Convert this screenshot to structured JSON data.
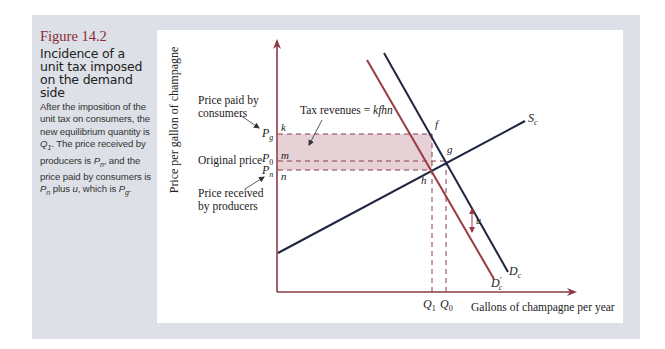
{
  "figure": {
    "number": "Figure 14.2",
    "title": "Incidence of a unit tax imposed on the demand side",
    "description_parts": [
      {
        "text": "After the imposition of the unit tax on consumers, the new equilibrium quantity is ",
        "italic": false
      },
      {
        "text": "Q",
        "italic": true
      },
      {
        "text": "1",
        "sub": true
      },
      {
        "text": ". The price received by producers is ",
        "italic": false
      },
      {
        "text": "P",
        "italic": true
      },
      {
        "text": "n",
        "sub": true
      },
      {
        "text": ", and the price paid by consumers is ",
        "italic": false
      },
      {
        "text": "P",
        "italic": true
      },
      {
        "text": "n",
        "sub": true
      },
      {
        "text": " plus ",
        "italic": false
      },
      {
        "text": "u",
        "italic": true
      },
      {
        "text": ", which is ",
        "italic": false
      },
      {
        "text": "P",
        "italic": true
      },
      {
        "text": "g",
        "sub": true
      },
      {
        "text": ".",
        "italic": false
      }
    ]
  },
  "colors": {
    "panel": "#dde0e6",
    "axis": "#8a3a45",
    "demand_original": "#1f2540",
    "demand_shifted": "#9a3a42",
    "supply": "#1f2540",
    "tax_area": "#e6d2d6",
    "title_accent": "#8a2a33"
  },
  "chart_data": {
    "type": "line",
    "title": "Incidence of a unit tax imposed on the demand side",
    "xlabel": "Gallons of champagne per year",
    "ylabel": "Price per gallon of champagne",
    "grid": false,
    "legend": "inline labels on curves",
    "series": [
      {
        "name": "S_c",
        "label": "Supply",
        "points": [
          [
            0,
            0.37
          ],
          [
            1.0,
            0.93
          ]
        ]
      },
      {
        "name": "D_c",
        "label": "Original demand",
        "points": [
          [
            0.33,
            1.0
          ],
          [
            0.7,
            0.08
          ]
        ]
      },
      {
        "name": "D'_c",
        "label": "Demand after unit tax (shifted down by u)",
        "points": [
          [
            0.27,
            0.97
          ],
          [
            0.65,
            0.05
          ]
        ]
      }
    ],
    "x_ticks": [
      "Q1",
      "Q0"
    ],
    "y_ticks": [
      "Pg",
      "P0",
      "Pn"
    ],
    "points": {
      "k": "on price axis at Pg",
      "m": "on price axis at P0",
      "n": "on price axis at Pn",
      "f": "on D_c at Q1, price Pg",
      "g": "original equilibrium (Q0, P0)",
      "h": "new equilibrium on D'_c and S_c (Q1, Pn)"
    },
    "annotations": [
      "Price paid by consumers",
      "Original price",
      "Price received by producers",
      "Tax revenues = kfhn",
      "u (vertical distance between D_c and D'_c)"
    ],
    "shaded_region": "kfhn = tax revenues"
  },
  "chart": {
    "y_axis_label": "Price per gallon of champagne",
    "x_axis_label": "Gallons of champagne per year",
    "annotation_paid_line1": "Price paid by",
    "annotation_paid_line2": "consumers",
    "annotation_original": "Original price",
    "annotation_received_line1": "Price received",
    "annotation_received_line2": "by producers",
    "tax_revenue_text": "Tax revenues = ",
    "tax_revenue_var": "kfhn",
    "tick_pg_main": "P",
    "tick_pg_sub": "g",
    "tick_p0_main": "P",
    "tick_p0_sub": "0",
    "tick_pn_main": "P",
    "tick_pn_sub": "n",
    "tick_q1_main": "Q",
    "tick_q1_sub": "1",
    "tick_q0_main": "Q",
    "tick_q0_sub": "0",
    "point_k": "k",
    "point_m": "m",
    "point_n": "n",
    "point_f": "f",
    "point_g": "g",
    "point_h": "h",
    "u_label": "u",
    "supply_main": "S",
    "supply_sub": "c",
    "demand_main": "D",
    "demand_sub": "c",
    "demand2_main": "D",
    "demand2_prime": "′",
    "demand2_sub": "c"
  }
}
